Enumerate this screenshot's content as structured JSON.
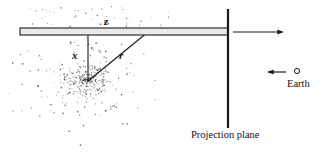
{
  "figure": {
    "name": "projection-plane-diagram",
    "background_color": "#fefefe",
    "ink_color": "#111111",
    "width": 328,
    "height": 153
  },
  "labels": {
    "z": "z",
    "x": "x",
    "r": "r",
    "earth": "Earth",
    "projection_plane": "Projection plane"
  },
  "elements": {
    "slab": {
      "name": "projection-slab-bar",
      "x1": 20,
      "y1": 28,
      "x2": 228,
      "y2": 35,
      "fill": "#e8e8e8",
      "stroke": "#1a1a1a"
    },
    "plane_line": {
      "name": "projection-plane-line",
      "x": 228,
      "y1": 9,
      "y2": 128,
      "stroke": "#1a1a1a",
      "width": 2.2
    },
    "x_line": {
      "name": "x-distance-line",
      "x1": 88,
      "y1": 32,
      "x2": 88,
      "y2": 81,
      "stroke": "#1a1a1a"
    },
    "r_line": {
      "name": "r-distance-line",
      "x1": 88,
      "y1": 81,
      "x2": 148,
      "y2": 32,
      "stroke": "#1a1a1a"
    },
    "right_arrow": {
      "name": "line-of-sight-arrow",
      "x1": 233,
      "y1": 32,
      "x2": 283,
      "y2": 32,
      "stroke": "#1a1a1a"
    },
    "earth_arrow": {
      "name": "earth-direction-arrow",
      "x1": 286,
      "y1": 72,
      "x2": 268,
      "y2": 72,
      "stroke": "#1a1a1a"
    },
    "earth_marker": {
      "name": "earth-circle-marker",
      "cx": 297,
      "cy": 71,
      "r": 2.6,
      "stroke": "#1a1a1a",
      "fill": "none"
    },
    "cluster": {
      "name": "galaxy-point-cluster",
      "center_x": 88,
      "center_y": 81,
      "core_radius": 17,
      "halo_radius": 62,
      "point_color": "#2a2a2a",
      "point_count": 430
    }
  }
}
